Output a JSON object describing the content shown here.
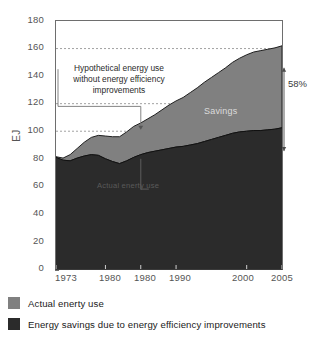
{
  "chart_data": {
    "type": "area",
    "stacked": true,
    "title": "",
    "subtitle": "",
    "xlabel": "",
    "ylabel": "EJ",
    "ylim": [
      0,
      180
    ],
    "xlim": [
      1973,
      2005
    ],
    "grid": "dashed-horizontal-partial",
    "legend_position": "below",
    "x": [
      1973,
      1974,
      1975,
      1976,
      1977,
      1978,
      1979,
      1980,
      1981,
      1982,
      1983,
      1984,
      1985,
      1986,
      1987,
      1988,
      1989,
      1990,
      1991,
      1992,
      1993,
      1994,
      1995,
      1996,
      1997,
      1998,
      1999,
      2000,
      2001,
      2002,
      2003,
      2004,
      2005
    ],
    "series": [
      {
        "name": "Actual enerty use",
        "stack_order": "top",
        "color": "#808080",
        "values": [
          0.5,
          1.5,
          4.5,
          7.0,
          10.0,
          12.5,
          14.5,
          16.5,
          18.0,
          19.5,
          21.0,
          22.5,
          23.0,
          24.5,
          26.5,
          29.0,
          31.5,
          33.5,
          35.5,
          38.0,
          40.5,
          43.0,
          45.0,
          47.0,
          49.0,
          51.5,
          53.5,
          55.5,
          57.0,
          58.0,
          58.5,
          59.0,
          59.5
        ]
      },
      {
        "name": "Energy savings due to energy efficiency improvements",
        "stack_order": "bottom",
        "color": "#2b2b2b",
        "values": [
          81.0,
          79.0,
          78.5,
          80.5,
          82.0,
          83.0,
          82.5,
          80.0,
          78.0,
          76.5,
          78.5,
          81.0,
          83.0,
          84.5,
          85.5,
          86.5,
          87.5,
          88.5,
          89.0,
          90.0,
          91.0,
          92.5,
          94.0,
          95.5,
          97.0,
          98.5,
          99.5,
          100.0,
          100.5,
          100.5,
          101.0,
          101.5,
          102.5
        ]
      }
    ],
    "totals": [
      81.5,
      80.5,
      83.0,
      87.5,
      92.0,
      95.5,
      97.0,
      96.5,
      96.0,
      96.0,
      99.5,
      103.5,
      106.0,
      109.0,
      112.0,
      115.5,
      119.0,
      122.0,
      124.5,
      128.0,
      131.5,
      135.5,
      139.0,
      142.5,
      146.0,
      150.0,
      153.0,
      155.5,
      157.5,
      158.5,
      159.5,
      160.5,
      162.0
    ],
    "y_ticks": [
      0,
      20,
      40,
      60,
      80,
      100,
      120,
      140,
      160,
      180
    ],
    "x_ticks": [
      "1973",
      "1980",
      "1980",
      "1990",
      "2000",
      "2005"
    ],
    "x_tick_values": [
      1973,
      1980,
      1985,
      1990,
      2000,
      2005
    ],
    "annotations": [
      {
        "name": "hypothetical-note",
        "line1": "Hypothetical energy use",
        "line2": "without energy efficiency",
        "line3": "improvements",
        "points_to_year": 1985,
        "points_to_value": 101
      },
      {
        "name": "savings-label",
        "text": "Savings"
      },
      {
        "name": "actual-use-label",
        "text": "Actual enerty use"
      },
      {
        "name": "savings-percent",
        "text": "58%"
      }
    ],
    "reference_lines": [
      100,
      120,
      160
    ]
  },
  "legend": {
    "items": [
      {
        "label": "Actual enerty use",
        "color": "#808080"
      },
      {
        "label": "Energy savings due to energy efficiency improvements",
        "color": "#2b2b2b"
      }
    ]
  },
  "axis": {
    "y_title": "EJ"
  }
}
